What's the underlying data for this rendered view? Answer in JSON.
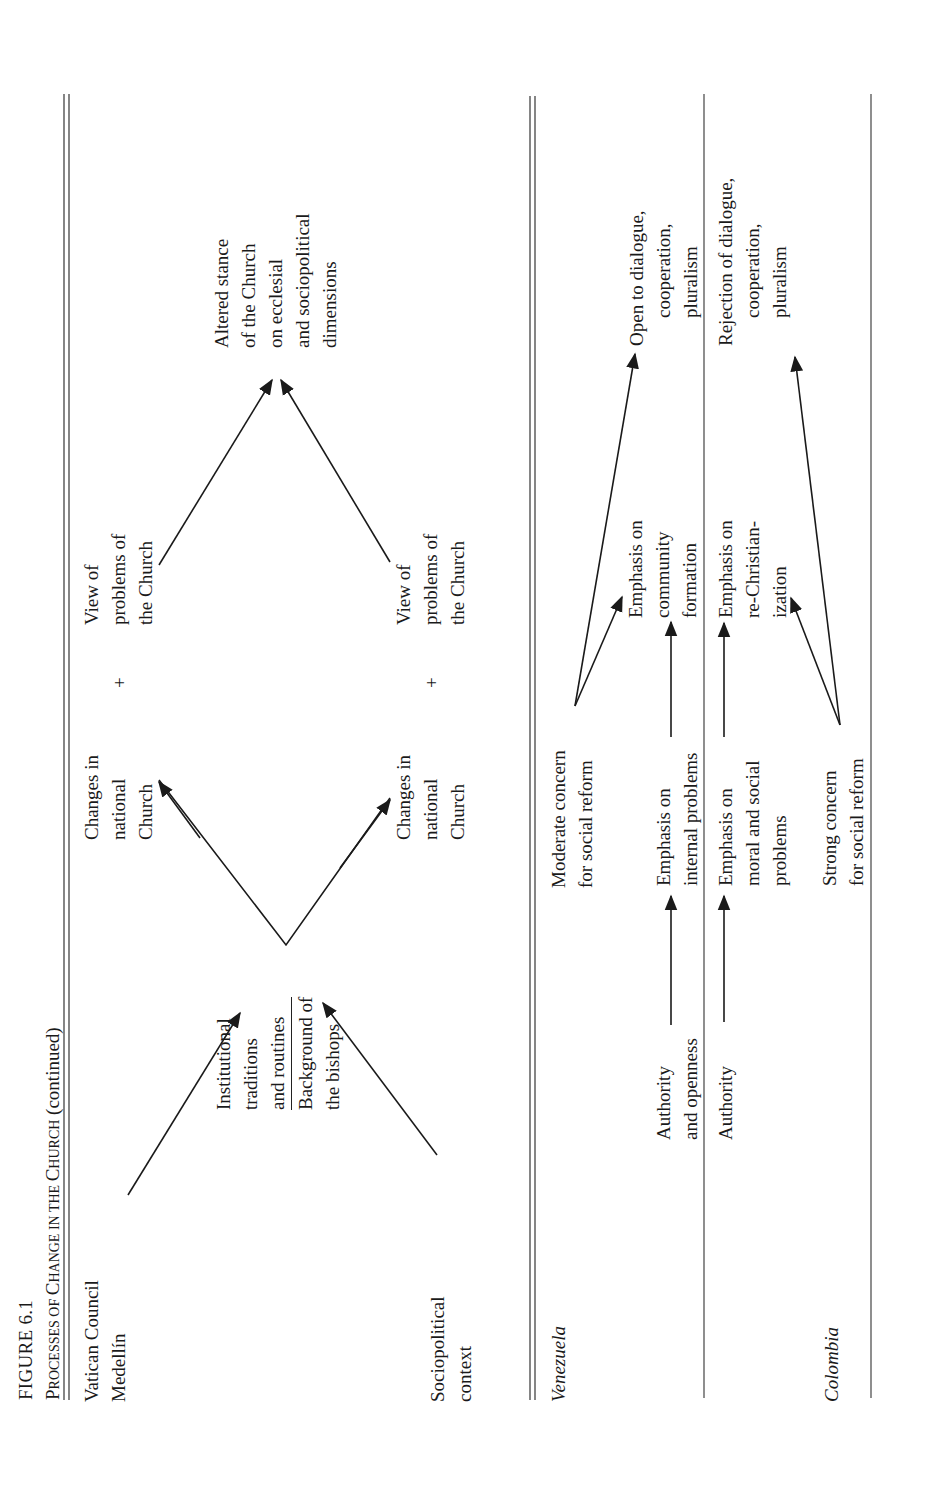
{
  "figure": {
    "label": "FIGURE 6.1",
    "title_parts": [
      {
        "text": "P",
        "small": false
      },
      {
        "text": "rocesses of ",
        "small": true
      },
      {
        "text": "C",
        "small": false
      },
      {
        "text": "hange in the ",
        "small": true
      },
      {
        "text": "C",
        "small": false
      },
      {
        "text": "hurch",
        "small": true
      }
    ],
    "title_plain": "Processes of Change in the Church",
    "title_suffix": "(continued)"
  },
  "general_model": {
    "inputs": {
      "vatican_council": [
        "Vatican Council",
        "Medellín"
      ],
      "sociopolitical_context": [
        "Sociopolitical",
        "context"
      ]
    },
    "mediators": {
      "institutional": [
        "Institutional",
        "traditions",
        "and routines"
      ],
      "background": [
        "Background of",
        "the bishops"
      ]
    },
    "outcomes_upper": {
      "changes": [
        "Changes in",
        "national",
        "Church"
      ],
      "plus": "+",
      "view": [
        "View of",
        "problems of",
        "the Church"
      ]
    },
    "outcomes_lower": {
      "changes": [
        "Changes in",
        "national",
        "Church"
      ],
      "plus": "+",
      "view": [
        "View of",
        "problems of",
        "the Church"
      ]
    },
    "result": [
      "Altered stance",
      "of the Church",
      "on ecclesial",
      "and sociopolitical",
      "dimensions"
    ]
  },
  "venezuela": {
    "label": "Venezuela",
    "moderate_concern": [
      "Moderate concern",
      "for social reform"
    ],
    "authority": [
      "Authority",
      "and openness"
    ],
    "emphasis_internal": [
      "Emphasis on",
      "internal problems"
    ],
    "emphasis_community": [
      "Emphasis on",
      "community",
      "formation"
    ],
    "outcome": [
      "Open to dialogue,",
      "cooperation,",
      "pluralism"
    ]
  },
  "colombia": {
    "label": "Colombia",
    "authority": [
      "Authority"
    ],
    "emphasis_moral": [
      "Emphasis on",
      "moral and social",
      "problems"
    ],
    "strong_concern": [
      "Strong concern",
      "for social reform"
    ],
    "emphasis_rechristian": [
      "Emphasis on",
      "re-Christian-",
      "ization"
    ],
    "outcome": [
      "Rejection of dialogue,",
      "cooperation,",
      "pluralism"
    ]
  },
  "colors": {
    "ink": "#1a1a1a",
    "rule": "#333333",
    "background": "#ffffff"
  }
}
